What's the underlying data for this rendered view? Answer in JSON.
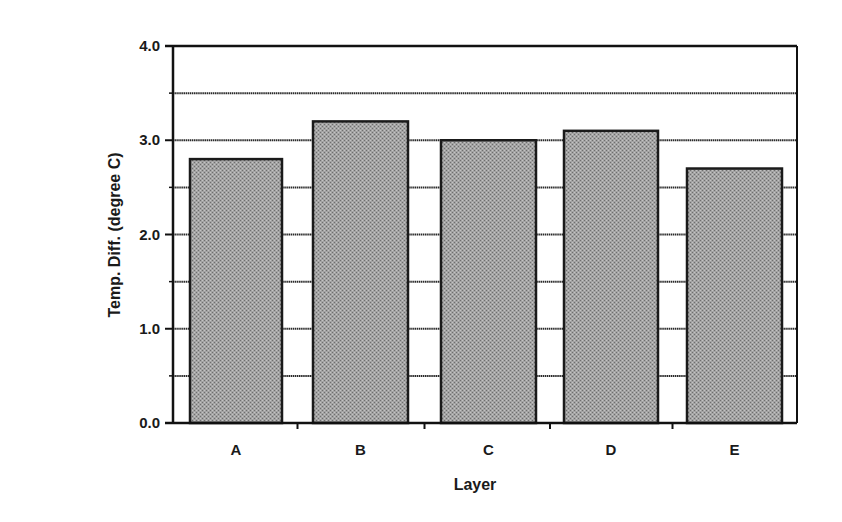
{
  "chart_data": {
    "type": "bar",
    "title": "",
    "xlabel": "Layer",
    "ylabel": "Temp. Diff. (degree C)",
    "categories": [
      "A",
      "B",
      "C",
      "D",
      "E"
    ],
    "values": [
      2.8,
      3.2,
      3.0,
      3.1,
      2.7
    ],
    "ylim": [
      0,
      4.0
    ],
    "yticks": [
      "0.0",
      "1.0",
      "2.0",
      "3.0",
      "4.0"
    ],
    "ytick_values": [
      0,
      1,
      2,
      3,
      4
    ],
    "minor_grid_step": 0.5,
    "grid": true,
    "legend": null,
    "bar_fill": "#9a9a9a",
    "bar_edge": "#1a1a1a"
  }
}
